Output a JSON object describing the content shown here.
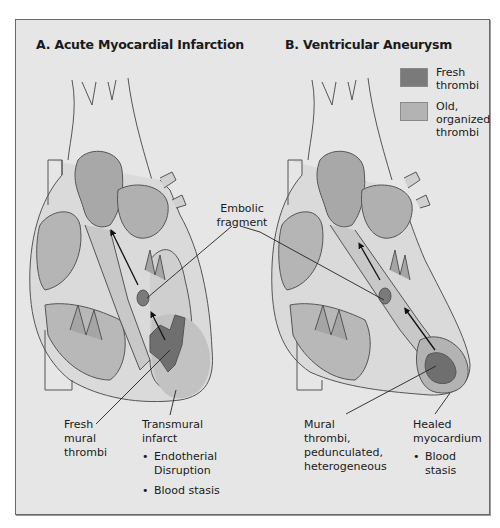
{
  "panels": {
    "a": {
      "title": "A. Acute Myocardial Infarction"
    },
    "b": {
      "title": "B. Ventricular Aneurysm"
    }
  },
  "legend": {
    "items": [
      {
        "label": "Fresh thrombi",
        "color": "#7a7a7a"
      },
      {
        "label": "Old, organized thrombi",
        "color": "#b3b3b3"
      }
    ]
  },
  "labels": {
    "embolic_fragment": "Embolic fragment",
    "a_fresh_mural_thrombi": "Fresh mural thrombi",
    "a_transmural_infarct": "Transmural infarct",
    "a_bullets": [
      "Endotherial Disruption",
      "Blood stasis"
    ],
    "b_mural_thrombi": "Mural thrombi, pedunculated, heterogeneous",
    "b_healed_myocardium": "Healed myocardium",
    "b_bullets": [
      "Blood stasis"
    ]
  },
  "colors": {
    "background": "#e6e6e6",
    "outline": "#555555",
    "chamber": "#bdbdbd",
    "fresh_thrombi": "#7a7a7a",
    "old_thrombi": "#b3b3b3"
  }
}
